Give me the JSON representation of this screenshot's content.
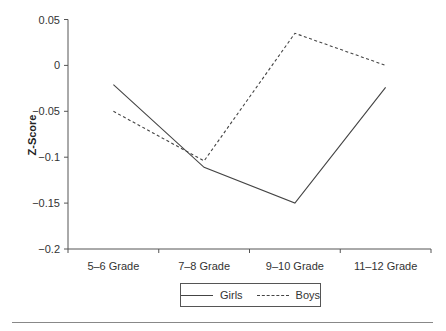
{
  "chart_data": {
    "type": "line",
    "title": "",
    "xlabel": "",
    "ylabel": "Z-Score",
    "categories": [
      "5–6 Grade",
      "7–8 Grade",
      "9–10 Grade",
      "11–12 Grade"
    ],
    "series": [
      {
        "name": "Girls",
        "style": "solid",
        "values": [
          -0.021,
          -0.111,
          -0.15,
          -0.024
        ]
      },
      {
        "name": "Boys",
        "style": "dashed",
        "values": [
          -0.05,
          -0.104,
          0.035,
          0.0
        ]
      }
    ],
    "ylim": [
      -0.2,
      0.05
    ],
    "yticks": [
      0.05,
      0,
      -0.05,
      -0.1,
      -0.15,
      -0.2
    ],
    "ytick_labels": [
      "0.05",
      "0",
      "−0.05",
      "−0.1",
      "−0.15",
      "−0.2"
    ],
    "grid": false,
    "legend_position": "bottom-center"
  },
  "legend": {
    "girls": "Girls",
    "boys": "Boys"
  },
  "colors": {
    "line": "#444444",
    "axis": "#555555"
  }
}
